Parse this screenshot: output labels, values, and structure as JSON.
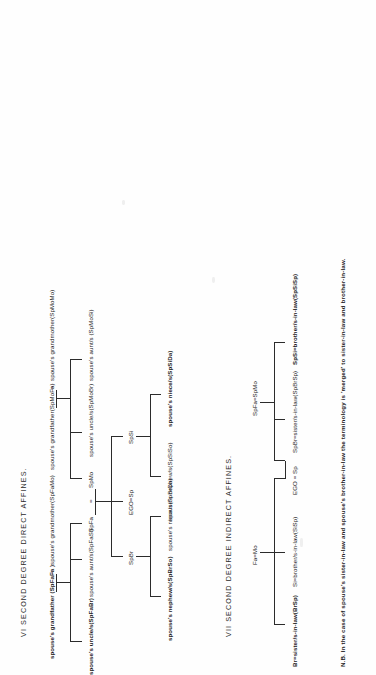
{
  "document": {
    "page_background": "#ffffff",
    "ink_color": "#222222"
  },
  "diagram_vi": {
    "title": "VI  SECOND DEGREE DIRECT AFFINES.",
    "generation_1": {
      "grandfather": "spouse's grandfather (SpFaFa )",
      "equals": "=",
      "grandmother": "spouse's grandmother(SpFaMo)",
      "grandfather_2": "spouse's grandfather(SpMoFa)",
      "equals_2": "=",
      "grandmother_2": "spouse's grandmother(SpMoMo)"
    },
    "generation_2": {
      "uncle_fa": "spouse's uncle/s(SpFaBr)",
      "aunt_fa": "spouse's aunt/s(SpFaSi)",
      "father": "SpFa",
      "equals": "=",
      "mother": "SpMo",
      "uncle_mo": "spouse's uncle/s(SpMoBr)",
      "aunt_mo": "spouse's aunt/s (SpMoSi)"
    },
    "generation_3": {
      "brother": "SpBr",
      "ego": "EGO=Sp",
      "sister": "SpSi"
    },
    "generation_4": {
      "nephew_br": "spouse's nephew/s(SpBrSo)",
      "niece_br": "spouse's niece/s(SpBrDa)",
      "nephew_si": "spouse's nephew/s(SpSiSo)",
      "niece_si": "spouse's niece/s(SpSiDa)"
    }
  },
  "diagram_vii": {
    "title": "VII  SECOND DEGREE INDIRECT AFFINES.",
    "parents_left": "Fa=Mo",
    "parents_right": "SpFa=SpMo",
    "siblings": {
      "brother_sister_in_law": "Br=sister/s-in-law(BrSp)",
      "sister_brother_in_law": "Si=brother/s-in-law(SiSp)",
      "ego": "EGO = Sp",
      "spouse_brother": "SpBr=sister/s-in-law(SpBrSp)",
      "spouse_sister": "SpSi=brother/s-in-law(SpSiSp)"
    }
  },
  "footnote": {
    "text": "N.B. In the case of spouse's sister-in-law and spouse's brother-in-law the terminology is 'merged' to sister-in-law and brother-in-law."
  }
}
